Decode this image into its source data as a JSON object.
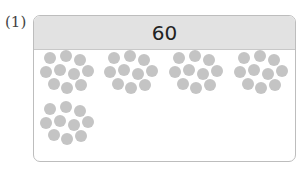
{
  "question_label": "(1)",
  "header_value": "60",
  "colors": {
    "header_bg": "#e2e2e2",
    "border": "#bdbdbd",
    "dot": "#c4c4c4"
  },
  "groups": {
    "count": 5,
    "dots_per_group": 10,
    "positions": [
      {
        "x": 6,
        "y": 34
      },
      {
        "x": 70,
        "y": 34
      },
      {
        "x": 135,
        "y": 34
      },
      {
        "x": 200,
        "y": 34
      },
      {
        "x": 6,
        "y": 85
      }
    ]
  },
  "dot_pattern": [
    [
      4,
      0
    ],
    [
      20,
      -2
    ],
    [
      34,
      2
    ],
    [
      0,
      14
    ],
    [
      14,
      12
    ],
    [
      28,
      16
    ],
    [
      42,
      13
    ],
    [
      8,
      26
    ],
    [
      21,
      30
    ],
    [
      35,
      27
    ]
  ]
}
